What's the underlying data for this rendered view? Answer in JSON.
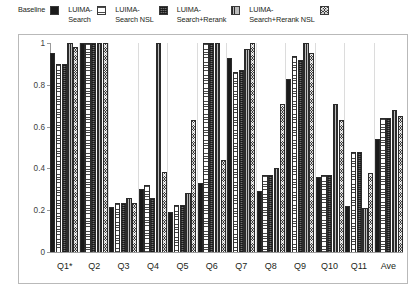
{
  "legend": {
    "entries": [
      {
        "label": "Baseline",
        "swatch": "solid-square-icon",
        "pattern": "pat-solid"
      },
      {
        "label": "LUIMA-\nSearch",
        "swatch": "horizontal-lines-square-icon",
        "pattern": "pat-hlines"
      },
      {
        "label": "LUIMA-\nSearch NSL",
        "swatch": "grid-square-icon",
        "pattern": "pat-grid"
      },
      {
        "label": "LUIMA-\nSearch+Rerank",
        "swatch": "vertical-lines-square-icon",
        "pattern": "pat-vlines"
      },
      {
        "label": "LUIMA-\nSearch+Rerank NSL",
        "swatch": "checker-square-icon",
        "pattern": "pat-checker"
      }
    ]
  },
  "chart_data": {
    "type": "bar",
    "title": "",
    "xlabel": "",
    "ylabel": "",
    "ylim": [
      0,
      1
    ],
    "yticks": [
      0,
      0.2,
      0.4,
      0.6,
      0.8,
      1
    ],
    "ytick_labels": [
      "0",
      "0.2",
      "0.4",
      "0.6",
      "0.8",
      "1"
    ],
    "grid": false,
    "legend_position": "top",
    "categories": [
      "Q1*",
      "Q2",
      "Q3",
      "Q4",
      "Q5",
      "Q6",
      "Q7",
      "Q8",
      "Q9",
      "Q10",
      "Q11",
      "Ave"
    ],
    "series": [
      {
        "name": "Baseline",
        "values": [
          0.95,
          1.0,
          0.215,
          0.3,
          0.19,
          0.33,
          0.93,
          0.29,
          0.83,
          0.36,
          0.22,
          0.54
        ]
      },
      {
        "name": "LUIMA-Search",
        "values": [
          0.9,
          1.0,
          0.235,
          0.32,
          0.225,
          1.0,
          0.86,
          0.37,
          0.94,
          0.37,
          0.48,
          0.64
        ]
      },
      {
        "name": "LUIMA-Search NSL",
        "values": [
          0.9,
          1.0,
          0.235,
          0.26,
          0.225,
          1.0,
          0.87,
          0.37,
          0.92,
          0.37,
          0.48,
          0.64
        ]
      },
      {
        "name": "LUIMA-Search+Rerank",
        "values": [
          1.0,
          1.0,
          0.26,
          1.0,
          0.28,
          1.0,
          0.97,
          0.4,
          1.0,
          0.71,
          0.21,
          0.68
        ]
      },
      {
        "name": "LUIMA-Search+Rerank NSL",
        "values": [
          0.98,
          1.0,
          0.235,
          0.385,
          0.63,
          0.44,
          1.0,
          0.71,
          0.95,
          0.63,
          0.38,
          0.65
        ]
      }
    ]
  }
}
